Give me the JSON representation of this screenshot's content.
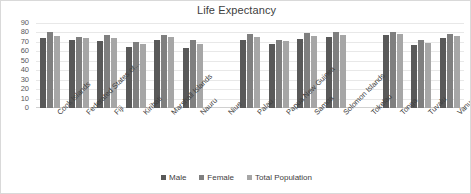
{
  "chart_data": {
    "type": "bar",
    "title": "Life Expectancy",
    "xlabel": "",
    "ylabel": "",
    "ylim": [
      0,
      90
    ],
    "yticks": [
      0,
      10,
      20,
      30,
      40,
      50,
      60,
      70,
      80,
      90
    ],
    "grid": true,
    "legend_position": "bottom",
    "categories": [
      "Cook Islands",
      "Federated States of...",
      "Fiji",
      "Kiribati",
      "Marshall Islands",
      "Nauru",
      "Niue",
      "Palau",
      "Papua New Guinea",
      "Samoa",
      "Solomon Islands",
      "Tokelau",
      "Tonga",
      "Tuvalu",
      "Vanuatu"
    ],
    "series": [
      {
        "name": "Male",
        "color": "#595959",
        "values": [
          74,
          72,
          71,
          65,
          72.5,
          64,
          null,
          71.5,
          67.5,
          73,
          75,
          null,
          77,
          67,
          74.5
        ]
      },
      {
        "name": "Female",
        "color": "#7f7f7f",
        "values": [
          80,
          75.5,
          77,
          70,
          77.5,
          71.5,
          null,
          78,
          72.5,
          79,
          81,
          null,
          80.5,
          72,
          78.5
        ]
      },
      {
        "name": "Total Population",
        "color": "#a6a6a6",
        "values": [
          76.5,
          74,
          74,
          67.5,
          75,
          68,
          null,
          75,
          70.5,
          76,
          77.5,
          null,
          78.5,
          69,
          76
        ]
      }
    ]
  },
  "legend": {
    "items": [
      {
        "label": "Male",
        "color": "#595959"
      },
      {
        "label": "Female",
        "color": "#7f7f7f"
      },
      {
        "label": "Total Population",
        "color": "#a6a6a6"
      }
    ]
  }
}
